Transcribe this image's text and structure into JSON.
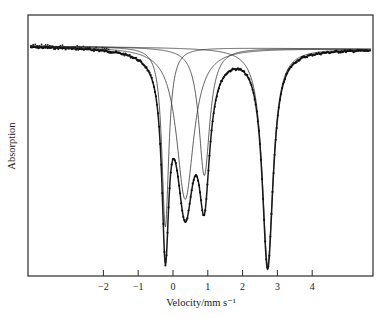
{
  "chart_data": {
    "type": "line",
    "title": "",
    "xlabel": "Velocity/mm s⁻¹",
    "ylabel": "Absorption",
    "xlim": [
      -4.3,
      5.6
    ],
    "x_ticks": [
      -2,
      -1,
      0,
      1,
      2,
      3,
      4
    ],
    "x_tick_labels": [
      "−2",
      "−1",
      "0",
      "1",
      "2",
      "3",
      "4"
    ],
    "y_ticks": [],
    "grid": false,
    "legend": null,
    "baseline": {
      "left_px": 46,
      "right_px": 49
    },
    "components": [
      {
        "name": "Lorentzian A",
        "center": -0.22,
        "depth_px": 180,
        "hwhm": 0.12
      },
      {
        "name": "Lorentzian B",
        "center": 0.35,
        "depth_px": 152,
        "hwhm": 0.3
      },
      {
        "name": "Lorentzian C",
        "center": 0.9,
        "depth_px": 128,
        "hwhm": 0.19
      },
      {
        "name": "Lorentzian D",
        "center": 2.72,
        "depth_px": 217,
        "hwhm": 0.19
      }
    ],
    "series": [
      {
        "name": "Experimental data",
        "style": "points"
      },
      {
        "name": "Total fit",
        "style": "solid-line"
      },
      {
        "name": "Fitted components",
        "style": "thin-lines"
      }
    ],
    "peak_positions_mm_s": [
      -0.22,
      0.35,
      0.9,
      2.72
    ]
  },
  "header": {
    "text": ""
  },
  "colors": {
    "ink": "#1a1a1a",
    "background": "#ffffff",
    "frame": "#2a2a2a"
  }
}
